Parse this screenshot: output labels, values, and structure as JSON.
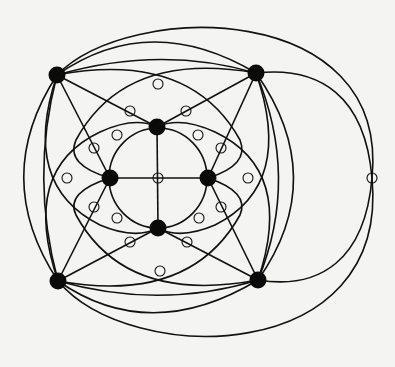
{
  "figure": {
    "title": "",
    "colors": {
      "background": "#f4f4f2",
      "ink": "#111111"
    }
  },
  "vertices": [
    {
      "id": "TL",
      "x": 57,
      "y": 75
    },
    {
      "id": "TR",
      "x": 256,
      "y": 73
    },
    {
      "id": "BL",
      "x": 58,
      "y": 281
    },
    {
      "id": "BR",
      "x": 258,
      "y": 280
    },
    {
      "id": "T",
      "x": 157,
      "y": 127
    },
    {
      "id": "L",
      "x": 110,
      "y": 178
    },
    {
      "id": "R",
      "x": 208,
      "y": 178
    },
    {
      "id": "B",
      "x": 158,
      "y": 228
    }
  ],
  "crossings": [
    {
      "x": 158,
      "y": 178
    },
    {
      "x": 158,
      "y": 84
    },
    {
      "x": 130,
      "y": 111
    },
    {
      "x": 186,
      "y": 111
    },
    {
      "x": 117,
      "y": 135
    },
    {
      "x": 198,
      "y": 135
    },
    {
      "x": 94,
      "y": 148
    },
    {
      "x": 221,
      "y": 148
    },
    {
      "x": 67,
      "y": 178
    },
    {
      "x": 248,
      "y": 178
    },
    {
      "x": 94,
      "y": 207
    },
    {
      "x": 221,
      "y": 207
    },
    {
      "x": 117,
      "y": 218
    },
    {
      "x": 199,
      "y": 218
    },
    {
      "x": 130,
      "y": 242
    },
    {
      "x": 187,
      "y": 242
    },
    {
      "x": 160,
      "y": 271
    },
    {
      "x": 372,
      "y": 178
    }
  ]
}
